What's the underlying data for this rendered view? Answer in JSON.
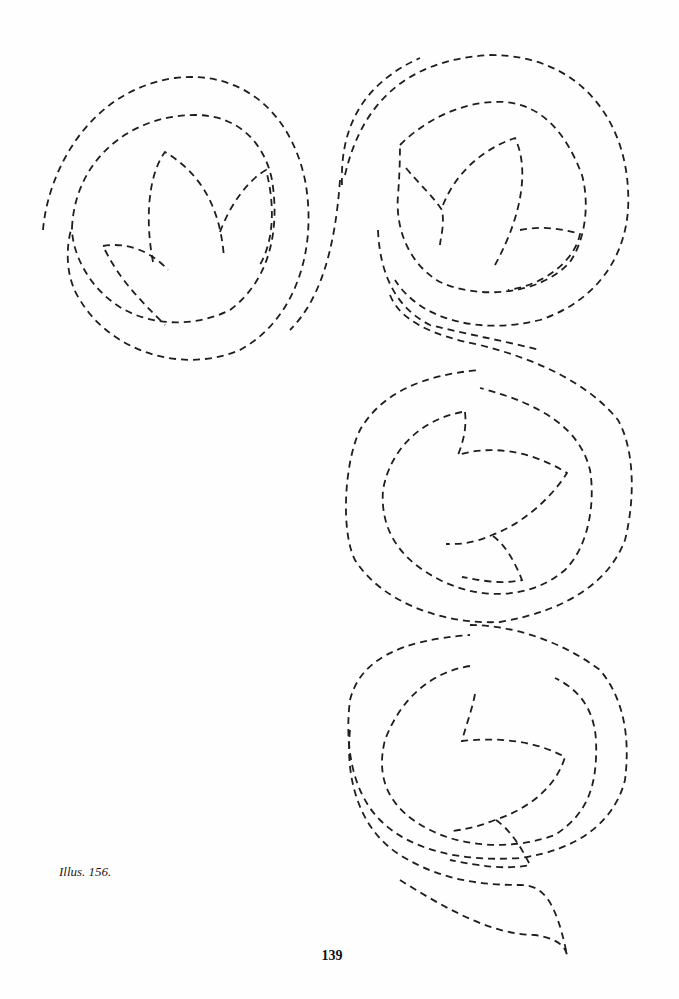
{
  "page": {
    "caption": "Illus. 156.",
    "page_number": "139"
  },
  "figure": {
    "stroke_color": "#1e1e1e",
    "background_color": "#ffffff",
    "medallions": [
      {
        "position": "top-left",
        "motif": "three-leaf bud"
      },
      {
        "position": "top-right",
        "motif": "three-leaf bud"
      },
      {
        "position": "middle-right",
        "motif": "sideways leaf with stem"
      },
      {
        "position": "bottom-right",
        "motif": "sideways leaf with stem"
      }
    ]
  }
}
